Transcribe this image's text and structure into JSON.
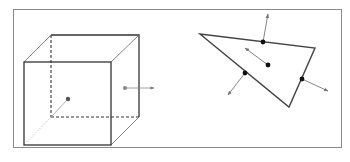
{
  "figure": {
    "frame": {
      "x": 13,
      "y": 9,
      "width": 328,
      "height": 138,
      "stroke": "#8a8a8a"
    },
    "cube": {
      "front": {
        "x": 24,
        "y": 62,
        "width": 87,
        "height": 83
      },
      "back": {
        "x": 51,
        "y": 35,
        "width": 88,
        "height": 82
      },
      "center_dot": {
        "x": 68,
        "y": 99,
        "color": "#555555"
      },
      "face_dot": {
        "x": 125,
        "y": 88,
        "color": "#888888"
      },
      "face_normal_end": {
        "x": 154,
        "y": 88
      },
      "stroke": "#333333"
    },
    "triangle": {
      "vertices": [
        [
          200,
          34
        ],
        [
          315,
          48
        ],
        [
          289,
          107
        ]
      ],
      "stroke": "#444444",
      "points": [
        {
          "name": "top-edge",
          "dot": [
            263,
            42
          ],
          "arrow_to": [
            268,
            14
          ]
        },
        {
          "name": "centroid",
          "dot": [
            268,
            65
          ],
          "arrow_to": [
            245,
            48
          ]
        },
        {
          "name": "left-edge",
          "dot": [
            245,
            73
          ],
          "arrow_to": [
            228,
            95
          ]
        },
        {
          "name": "right-edge",
          "dot": [
            302,
            79
          ],
          "arrow_to": [
            328,
            91
          ]
        }
      ]
    }
  }
}
